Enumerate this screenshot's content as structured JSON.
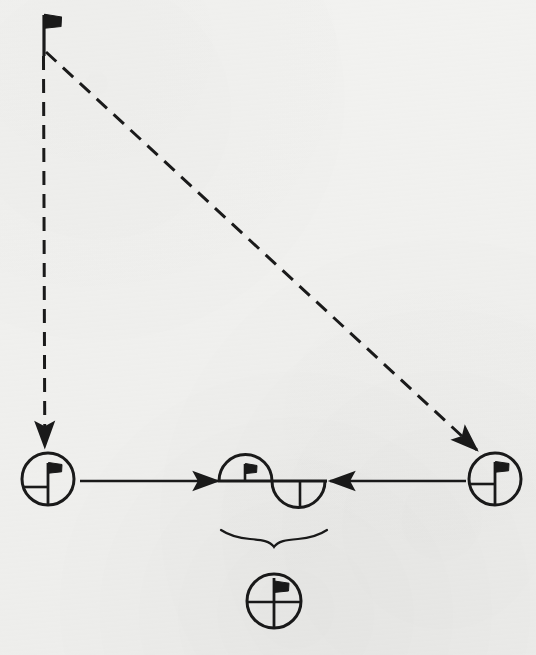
{
  "figure": {
    "kind": "hand-drawn-schematic-diagram",
    "background_color": "#f2f2f0",
    "ink_color": "#1a1a1a",
    "canvas": {
      "width": 536,
      "height": 655
    }
  },
  "nodes": {
    "top_flag": {
      "icon": "flag-icon",
      "label": "",
      "x": 44,
      "y": 14,
      "pole_height": 40,
      "flag_width": 17,
      "flag_height": 13
    },
    "left_circle_flag": {
      "icon": "circled-flag-icon",
      "label": "",
      "cx": 48,
      "cy": 479,
      "r": 26,
      "has_horizontal_diameter": true,
      "horizontal_extent": "left-half",
      "has_vertical_pole": true
    },
    "right_circle_flag": {
      "icon": "circled-flag-icon",
      "label": "",
      "cx": 495,
      "cy": 479,
      "r": 26,
      "has_horizontal_diameter": true,
      "horizontal_extent": "left-half",
      "has_vertical_pole": true
    },
    "center_sine_flag": {
      "icon": "sine-lobes-flag-icon",
      "label": "",
      "cx": 272,
      "cy": 479,
      "lobe_radius": 27,
      "upper_lobe_side": "left",
      "lower_lobe_side": "right",
      "upper_lobe_contains_flag": true,
      "lower_lobe_has_divider": true
    },
    "bottom_circle_flag": {
      "icon": "crossed-circled-flag-icon",
      "label": "",
      "cx": 274,
      "cy": 601,
      "r": 27,
      "has_horizontal_diameter": true,
      "horizontal_extent": "full",
      "has_vertical_pole": true
    }
  },
  "connectors": [
    {
      "name": "vertical-dashed-arrow",
      "style": "dashed",
      "from": {
        "x": 44,
        "y": 55
      },
      "to": {
        "x": 45,
        "y": 449
      },
      "arrowhead": "end",
      "dash_pattern": "14 9"
    },
    {
      "name": "diagonal-dashed-arrow",
      "style": "dashed",
      "from": {
        "x": 46,
        "y": 52
      },
      "to": {
        "x": 479,
        "y": 452
      },
      "arrowhead": "end",
      "dash_pattern": "14 9"
    },
    {
      "name": "left-solid-arrow",
      "style": "solid",
      "from": {
        "x": 80,
        "y": 481
      },
      "to": {
        "x": 222,
        "y": 481
      },
      "arrowhead": "end",
      "direction": "right"
    },
    {
      "name": "right-solid-arrow",
      "style": "solid",
      "from": {
        "x": 465,
        "y": 481
      },
      "to": {
        "x": 325,
        "y": 481
      },
      "arrowhead": "end",
      "direction": "left"
    }
  ],
  "annotations": {
    "underbrace": {
      "name": "underbrace",
      "label": "",
      "left_x": 221,
      "right_x": 327,
      "top_y": 528,
      "tip_x": 274,
      "tip_y": 548
    }
  }
}
